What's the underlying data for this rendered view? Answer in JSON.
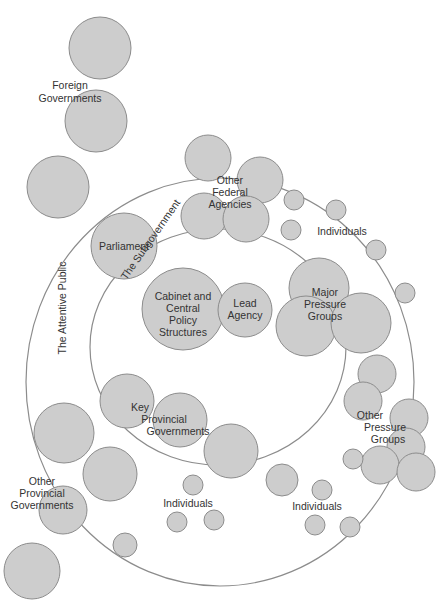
{
  "diagram": {
    "colors": {
      "bubble_fill": "#cdcdcd",
      "bubble_stroke": "#8c8c8c",
      "ring_stroke": "#8c8c8c",
      "text": "#333333"
    },
    "rings": [
      {
        "name": "The Attentive Public",
        "cx": 220,
        "cy": 382,
        "rx": 194,
        "ry": 204
      },
      {
        "name": "The Subgovernment",
        "cx": 218,
        "cy": 347,
        "rx": 128,
        "ry": 118
      }
    ],
    "labels": {
      "foreign_governments": [
        "Foreign",
        "Governments"
      ],
      "other_federal_agencies": [
        "Other",
        "Federal",
        "Agencies"
      ],
      "individuals_top": "Individuals",
      "parliament": "Parliament",
      "subgovernment": "The Subgovernment",
      "attentive_public": "The Attentive Public",
      "cabinet": [
        "Cabinet and",
        "Central",
        "Policy",
        "Structures"
      ],
      "lead_agency": [
        "Lead",
        "Agency"
      ],
      "major_pressure_groups": [
        "Major",
        "Pressure",
        "Groups"
      ],
      "key_provincial_governments": [
        "Key",
        "Provincial",
        "Governments"
      ],
      "other_pressure_groups": [
        "Other",
        "Pressure",
        "Groups"
      ],
      "other_provincial_governments": [
        "Other",
        "Provincial",
        "Governments"
      ],
      "individuals_bottom_left": "Individuals",
      "individuals_bottom_right": "Individuals"
    }
  }
}
